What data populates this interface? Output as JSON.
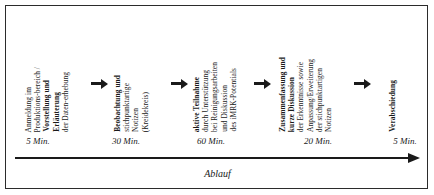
{
  "figure": {
    "axis_label": "Ablauf",
    "line_color": "#1a1a1a",
    "border_color": "#2b2b2b",
    "background": "#ffffff"
  },
  "steps": [
    {
      "id": "step-anmeldung",
      "duration": "5 Min.",
      "lines": [
        {
          "text": "Anmeldung im",
          "bold": false
        },
        {
          "text": "Produktions-bereich /",
          "bold": false
        },
        {
          "text": "Vorstellung und",
          "bold": true
        },
        {
          "text": "Erläuterung",
          "bold": true
        },
        {
          "text": "der Daten-erhebung",
          "bold": false
        }
      ]
    },
    {
      "id": "step-beobachtung",
      "duration": "30 Min.",
      "lines": [
        {
          "text": "Beobachtung und",
          "bold": true
        },
        {
          "text": "stichpunktartige",
          "bold": false
        },
        {
          "text": "Notizen",
          "bold": false
        },
        {
          "text": "(Kreidekreis)",
          "bold": false
        }
      ]
    },
    {
      "id": "step-teilnahme",
      "duration": "60 Min.",
      "lines": [
        {
          "text": "aktive Teilnahme",
          "bold": true
        },
        {
          "text": "durch Unterstützung",
          "bold": false
        },
        {
          "text": "bei Reinigungsarbeiten",
          "bold": false
        },
        {
          "text": "und Diskussion",
          "bold": false
        },
        {
          "text": "des iMRK-Potentials",
          "bold": false
        }
      ]
    },
    {
      "id": "step-zusammenfassung",
      "duration": "20 Min.",
      "lines": [
        {
          "text": "Zusammenfassung und",
          "bold": true
        },
        {
          "text": "kurze Diskussion",
          "bold": true
        },
        {
          "text": "der Erkenntnisse sowie",
          "bold": false
        },
        {
          "text": "Anpassung/Erweiterung",
          "bold": false
        },
        {
          "text": "der stichpunktartigen",
          "bold": false
        },
        {
          "text": "Notizen",
          "bold": false
        }
      ]
    },
    {
      "id": "step-verabschiedung",
      "duration": "5 Min.",
      "lines": [
        {
          "text": "Verabschiedung",
          "bold": true
        }
      ]
    }
  ],
  "connectors": [
    {
      "id": "connector-1"
    },
    {
      "id": "connector-2"
    },
    {
      "id": "connector-3"
    },
    {
      "id": "connector-4"
    }
  ]
}
